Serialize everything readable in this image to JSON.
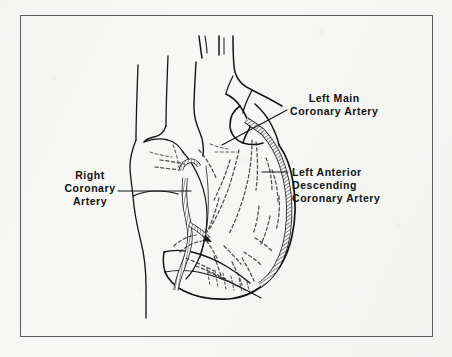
{
  "figure": {
    "kind": "anatomical-line-drawing",
    "background_color": "#f7f7f6",
    "ink_color": "#111111",
    "frame_color": "#5a5a5a"
  },
  "labels": {
    "left_main": {
      "name": "left-main-coronary-artery",
      "lines": [
        "Left Main",
        "Coronary Artery"
      ]
    },
    "left_anterior_descending": {
      "name": "left-anterior-descending-coronary-artery",
      "lines": [
        "Left Anterior",
        "Descending",
        "Coronary Artery"
      ]
    },
    "right_coronary": {
      "name": "right-coronary-artery",
      "lines": [
        "Right",
        "Coronary",
        "Artery"
      ]
    }
  },
  "structures": [
    {
      "name": "aorta",
      "style": "solid-outline"
    },
    {
      "name": "brachiocephalic-branch-stubs",
      "style": "solid-outline",
      "count": 2
    },
    {
      "name": "superior-vena-cava",
      "style": "solid-outline"
    },
    {
      "name": "pulmonary-artery",
      "style": "solid-outline"
    },
    {
      "name": "right-atrium",
      "style": "solid-outline"
    },
    {
      "name": "right-ventricle",
      "style": "solid-outline"
    },
    {
      "name": "left-ventricle",
      "style": "solid-outline"
    },
    {
      "name": "left-main-coronary-artery-vessel",
      "style": "hatched-band"
    },
    {
      "name": "left-anterior-descending-vessel",
      "style": "hatched-band"
    },
    {
      "name": "right-coronary-artery-vessel",
      "style": "hatched-band"
    },
    {
      "name": "posterior-coronary-branches",
      "style": "dashed"
    },
    {
      "name": "diagonal-branches",
      "style": "dashed"
    }
  ]
}
